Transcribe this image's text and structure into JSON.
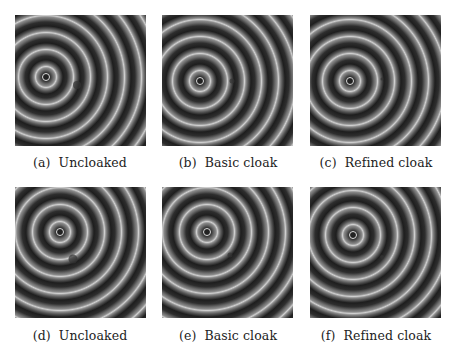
{
  "figure": {
    "panels": [
      {
        "tag": "(a)",
        "label": "Uncloaked",
        "src_x": 31,
        "src_y": 62,
        "defect": true,
        "defect_x": 62,
        "defect_y": 70,
        "defect_size": 8
      },
      {
        "tag": "(b)",
        "label": "Basic cloak",
        "src_x": 38,
        "src_y": 66,
        "defect": true,
        "defect_x": 70,
        "defect_y": 66,
        "defect_size": 5
      },
      {
        "tag": "(c)",
        "label": "Refined cloak",
        "src_x": 40,
        "src_y": 66,
        "defect": true,
        "defect_x": 72,
        "defect_y": 64,
        "defect_size": 3
      },
      {
        "tag": "(d)",
        "label": "Uncloaked",
        "src_x": 45,
        "src_y": 45,
        "defect": true,
        "defect_x": 58,
        "defect_y": 72,
        "defect_size": 9
      },
      {
        "tag": "(e)",
        "label": "Basic cloak",
        "src_x": 45,
        "src_y": 45,
        "defect": true,
        "defect_x": 68,
        "defect_y": 68,
        "defect_size": 5
      },
      {
        "tag": "(f)",
        "label": "Refined cloak",
        "src_x": 43,
        "src_y": 48,
        "defect": true,
        "defect_x": 72,
        "defect_y": 70,
        "defect_size": 4
      }
    ]
  }
}
